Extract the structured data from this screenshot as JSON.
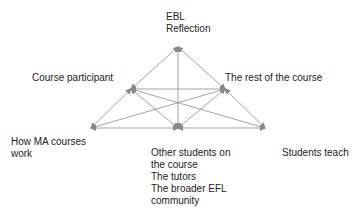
{
  "diagram": {
    "nodes": [
      {
        "id": "top",
        "lines": [
          "EBL",
          "Reflection"
        ]
      },
      {
        "id": "left_mid",
        "lines": [
          "Course participant"
        ]
      },
      {
        "id": "right_mid",
        "lines": [
          "The rest of the course"
        ]
      },
      {
        "id": "bottom_left",
        "lines": [
          "How MA courses",
          "work"
        ]
      },
      {
        "id": "bottom_center",
        "lines": [
          "Other students on",
          "the course",
          "The tutors",
          "The broader EFL",
          "community"
        ]
      },
      {
        "id": "bottom_right",
        "lines": [
          "Students teach"
        ]
      }
    ],
    "edges": [
      [
        "top",
        "left_mid"
      ],
      [
        "top",
        "right_mid"
      ],
      [
        "top",
        "bottom_center"
      ],
      [
        "left_mid",
        "right_mid"
      ],
      [
        "left_mid",
        "bottom_left"
      ],
      [
        "left_mid",
        "bottom_center"
      ],
      [
        "left_mid",
        "bottom_right"
      ],
      [
        "right_mid",
        "bottom_left"
      ],
      [
        "right_mid",
        "bottom_center"
      ],
      [
        "right_mid",
        "bottom_right"
      ],
      [
        "bottom_left",
        "bottom_center"
      ],
      [
        "bottom_center",
        "bottom_right"
      ]
    ],
    "line_color": "#888888",
    "arrows": "bidirectional"
  }
}
